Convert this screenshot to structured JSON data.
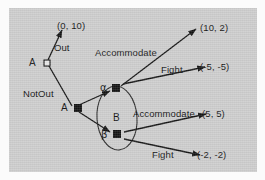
{
  "figure": {
    "type": "game-tree",
    "background_color": "#cdcdcd",
    "ink_color": "#131313"
  },
  "nodes": [
    {
      "id": "A1",
      "label": "A",
      "player": "A",
      "shape": "open-square",
      "x": 44,
      "y": 63
    },
    {
      "id": "A2",
      "label": "A",
      "player": "A",
      "shape": "filled-square",
      "x": 74,
      "y": 108
    },
    {
      "id": "alpha",
      "label": "α",
      "player": "B",
      "shape": "filled-square",
      "x": 115,
      "y": 89
    },
    {
      "id": "beta",
      "label": "β",
      "player": "B",
      "shape": "filled-square",
      "x": 116,
      "y": 130
    }
  ],
  "information_set": {
    "label": "B",
    "player": "B",
    "contains": [
      "alpha",
      "beta"
    ],
    "shape": "ellipse"
  },
  "actions": {
    "out": "Out",
    "not_out": "NotOut",
    "accommodate_top": "Accommodate",
    "fight_top": "Fight",
    "accommodate_bottom": "Accommodate",
    "fight_bottom": "Fight"
  },
  "payoffs": [
    {
      "from": "A1",
      "action": "Out",
      "value": "(0, 10)"
    },
    {
      "from": "alpha",
      "action": "Accommodate",
      "value": "(10, 2)"
    },
    {
      "from": "alpha",
      "action": "Fight",
      "value": "(-5, -5)"
    },
    {
      "from": "beta",
      "action": "Accommodate",
      "value": "(5, 5)"
    },
    {
      "from": "beta",
      "action": "Fight",
      "value": "(-2, -2)"
    }
  ],
  "labels": {
    "player_a_root": "A",
    "player_a_second": "A",
    "alpha": "α",
    "beta": "β",
    "infoset_b": "B",
    "out": "Out",
    "not_out": "NotOut",
    "accommodate_top": "Accommodate",
    "fight_top": "Fight",
    "accommodate_bottom": "Accommodate",
    "fight_bottom": "Fight",
    "payoff_out": "(0, 10)",
    "payoff_acc_top": "(10, 2)",
    "payoff_fight_top": "(-5, -5)",
    "payoff_acc_bottom": "(5, 5)",
    "payoff_fight_bottom": "(-2, -2)"
  }
}
